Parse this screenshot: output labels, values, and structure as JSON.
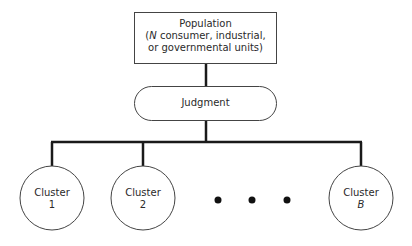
{
  "diagram": {
    "population": {
      "line1": "Population",
      "line2_prefix": "(",
      "line2_var": "N",
      "line2_rest": " consumer, industrial,",
      "line3": "or governmental units)"
    },
    "judgment": {
      "label": "Judgment"
    },
    "clusters": [
      {
        "name": "Cluster",
        "id": "1"
      },
      {
        "name": "Cluster",
        "id": "2"
      },
      {
        "name": "Cluster",
        "id": "B"
      }
    ],
    "ellipsis": "• • •",
    "colors": {
      "line": "#1a1a1a",
      "stroke": "#444444",
      "background": "#ffffff"
    }
  }
}
